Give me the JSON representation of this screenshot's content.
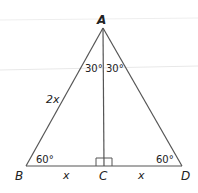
{
  "diagram": {
    "vertices": {
      "A": "A",
      "B": "B",
      "C": "C",
      "D": "D"
    },
    "side_labels": {
      "AB": "2x",
      "BC": "x",
      "CD": "x"
    },
    "angle_labels": {
      "BAC": "30°",
      "CAD": "30°",
      "ABC": "60°",
      "ADC": "60°"
    },
    "right_angle_at": "C",
    "colors": {
      "line": "#555555",
      "text": "#222222",
      "faint_line": "#e6e6e6"
    }
  }
}
